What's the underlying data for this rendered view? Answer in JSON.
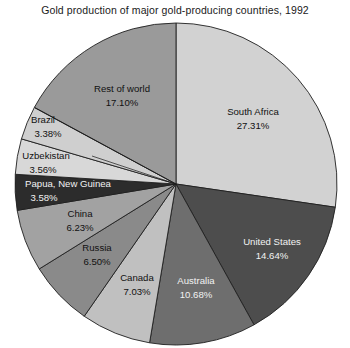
{
  "chart_data": {
    "type": "pie",
    "title": "Gold production of major gold-producing countries, 1992",
    "xlabel": "",
    "ylabel": "",
    "legend": "none",
    "grid": false,
    "value_unit": "percent",
    "categories": [
      "South Africa",
      "United States",
      "Australia",
      "Canada",
      "Russia",
      "China",
      "Papua, New Guinea",
      "Uzbekistan",
      "Brazil",
      "Rest of world"
    ],
    "values": [
      27.31,
      14.64,
      10.68,
      7.03,
      6.5,
      6.23,
      3.58,
      3.56,
      3.38,
      17.1
    ],
    "value_labels": [
      "27.31%",
      "14.64%",
      "10.68%",
      "7.03%",
      "6.50%",
      "6.23%",
      "3.58%",
      "3.56%",
      "3.38%",
      "17.10%"
    ],
    "colors": [
      "#d2d2d2",
      "#4d4d4d",
      "#6e6e6e",
      "#c0c0c0",
      "#8a8a8a",
      "#a2a2a2",
      "#2c2c2c",
      "#d8d8d8",
      "#cfcfcf",
      "#9a9a9a"
    ],
    "slices": [
      {
        "label": "South Africa",
        "value_label": "27.31%",
        "value": 27.31,
        "color": "#d2d2d2",
        "label_x": 253,
        "label_y": 112,
        "value_x": 253,
        "value_y": 126,
        "dark_text": false,
        "leader": false
      },
      {
        "label": "United States",
        "value_label": "14.64%",
        "value": 14.64,
        "color": "#4d4d4d",
        "label_x": 272,
        "label_y": 242,
        "value_x": 272,
        "value_y": 256,
        "dark_text": true,
        "leader": false
      },
      {
        "label": "Australia",
        "value_label": "10.68%",
        "value": 10.68,
        "color": "#6e6e6e",
        "label_x": 196,
        "label_y": 281,
        "value_x": 196,
        "value_y": 295,
        "dark_text": true,
        "leader": false
      },
      {
        "label": "Canada",
        "value_label": "7.03%",
        "value": 7.03,
        "color": "#c0c0c0",
        "label_x": 137,
        "label_y": 278,
        "value_x": 137,
        "value_y": 292,
        "dark_text": false,
        "leader": false
      },
      {
        "label": "Russia",
        "value_label": "6.50%",
        "value": 6.5,
        "color": "#8a8a8a",
        "label_x": 97,
        "label_y": 248,
        "value_x": 97,
        "value_y": 262,
        "dark_text": false,
        "leader": false
      },
      {
        "label": "China",
        "value_label": "6.23%",
        "value": 6.23,
        "color": "#a2a2a2",
        "label_x": 80,
        "label_y": 214,
        "value_x": 80,
        "value_y": 228,
        "dark_text": false,
        "leader": false
      },
      {
        "label": "Papua, New Guinea",
        "value_label": "3.58%",
        "value": 3.58,
        "color": "#2c2c2c",
        "label_x": 68,
        "label_y": 184,
        "value_x": 44,
        "value_y": 198,
        "dark_text": true,
        "leader": false
      },
      {
        "label": "Uzbekistan",
        "value_label": "3.56%",
        "value": 3.56,
        "color": "#d8d8d8",
        "label_x": 46,
        "label_y": 156,
        "value_x": 43,
        "value_y": 170,
        "dark_text": false,
        "leader": true,
        "leader_x1": 92,
        "leader_y1": 156,
        "leader_x2": 176,
        "leader_y2": 184
      },
      {
        "label": "Brazil",
        "value_label": "3.38%",
        "value": 3.38,
        "color": "#cfcfcf",
        "label_x": 43,
        "label_y": 120,
        "value_x": 48,
        "value_y": 134,
        "dark_text": false,
        "leader": true,
        "leader_x1": 35,
        "leader_y1": 108,
        "leader_x2": 176,
        "leader_y2": 184
      },
      {
        "label": "Rest of world",
        "value_label": "17.10%",
        "value": 17.1,
        "color": "#9a9a9a",
        "label_x": 122,
        "label_y": 89,
        "value_x": 122,
        "value_y": 103,
        "dark_text": false,
        "leader": false
      }
    ],
    "geometry": {
      "cx": 176,
      "cy": 184,
      "r": 161,
      "start_angle_deg": -90,
      "direction": "clockwise"
    }
  }
}
